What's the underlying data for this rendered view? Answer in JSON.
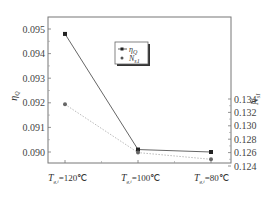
{
  "chart_data": {
    "type": "line",
    "title": "",
    "categories": [
      "T_g,i=120℃",
      "T_g,i=100℃",
      "T_g,i=80℃"
    ],
    "xlabel": "",
    "ylabel": "η_Q",
    "y2label": "N_s1",
    "ylim": [
      0.0895,
      0.0955
    ],
    "y2lim": [
      0.124,
      0.1348
    ],
    "yticks": [
      "0.090",
      "0.091",
      "0.092",
      "0.093",
      "0.094",
      "0.095"
    ],
    "y2ticks": [
      "0.124",
      "0.126",
      "0.128",
      "0.130",
      "0.132",
      "0.134"
    ],
    "series": [
      {
        "name": "η_Q",
        "axis": "left",
        "marker": "square",
        "line": "solid",
        "values": [
          0.0948,
          0.0901,
          0.09
        ]
      },
      {
        "name": "N_s1",
        "axis": "right",
        "marker": "circle",
        "line": "dotted",
        "values": [
          0.1332,
          0.126,
          0.125
        ]
      }
    ],
    "legend": {
      "position": "upper-center",
      "entries": [
        "η_Q",
        "N_s1"
      ]
    },
    "grid": false
  },
  "labels": {
    "y_left_main": "η",
    "y_left_sub": "Q",
    "y_right_main": "N",
    "y_right_sub": "s1",
    "cat_main": "T",
    "cat_sub": "g,i",
    "cat_values": [
      "=120℃",
      "=100℃",
      "=80℃"
    ],
    "legend_eta_main": "η",
    "legend_eta_sub": "Q",
    "legend_n_main": "N",
    "legend_n_sub": "s1"
  }
}
